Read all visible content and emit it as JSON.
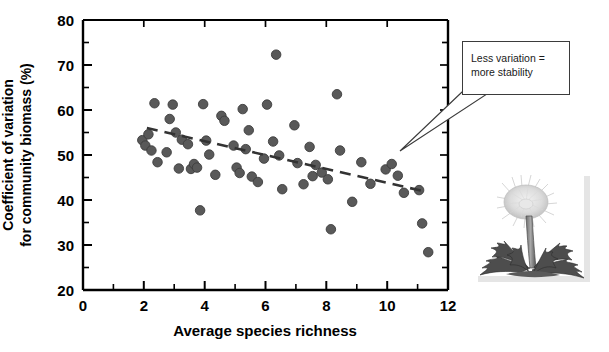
{
  "chart_data": {
    "type": "scatter",
    "title": "",
    "xlabel": "Average species richness",
    "ylabel": "Coefficient of variation\nfor community biomass (%)",
    "xlim": [
      0,
      12
    ],
    "ylim": [
      20,
      80
    ],
    "xticks": [
      0,
      2,
      4,
      6,
      8,
      10,
      12
    ],
    "yticks": [
      20,
      30,
      40,
      50,
      60,
      70,
      80
    ],
    "xtick_labels": [
      "0",
      "2",
      "4",
      "6",
      "8",
      "10",
      "12"
    ],
    "ytick_labels": [
      "20",
      "30",
      "40",
      "50",
      "60",
      "70",
      "80"
    ],
    "x_minor_ticks": [
      1,
      3,
      5,
      7,
      9,
      11
    ],
    "y_minor_ticks": [
      25,
      35,
      45,
      55,
      65,
      75
    ],
    "grid": false,
    "legend": null,
    "marker_color": "#595959",
    "marker_edge_color": "#3d3d3d",
    "marker_size": 9.5,
    "series": [
      {
        "name": "plots",
        "points": [
          [
            1.95,
            53.3
          ],
          [
            2.05,
            52.1
          ],
          [
            2.15,
            54.6
          ],
          [
            2.25,
            51.0
          ],
          [
            2.35,
            61.5
          ],
          [
            2.45,
            48.4
          ],
          [
            2.75,
            50.6
          ],
          [
            2.85,
            58.0
          ],
          [
            2.95,
            61.2
          ],
          [
            3.05,
            55.0
          ],
          [
            3.15,
            47.0
          ],
          [
            3.25,
            53.4
          ],
          [
            3.45,
            52.4
          ],
          [
            3.55,
            46.9
          ],
          [
            3.65,
            48.0
          ],
          [
            3.75,
            47.2
          ],
          [
            3.85,
            37.7
          ],
          [
            3.95,
            61.3
          ],
          [
            4.05,
            53.2
          ],
          [
            4.15,
            50.1
          ],
          [
            4.35,
            45.6
          ],
          [
            4.55,
            58.7
          ],
          [
            4.65,
            57.6
          ],
          [
            4.95,
            52.1
          ],
          [
            5.05,
            47.2
          ],
          [
            5.15,
            46.0
          ],
          [
            5.25,
            60.2
          ],
          [
            5.35,
            51.3
          ],
          [
            5.45,
            55.5
          ],
          [
            5.55,
            45.2
          ],
          [
            5.75,
            44.0
          ],
          [
            5.95,
            49.2
          ],
          [
            6.05,
            61.2
          ],
          [
            6.25,
            53.0
          ],
          [
            6.35,
            72.3
          ],
          [
            6.45,
            49.9
          ],
          [
            6.55,
            42.4
          ],
          [
            6.95,
            56.6
          ],
          [
            7.05,
            48.2
          ],
          [
            7.25,
            43.5
          ],
          [
            7.45,
            51.8
          ],
          [
            7.55,
            45.3
          ],
          [
            7.65,
            47.8
          ],
          [
            7.85,
            46.1
          ],
          [
            8.05,
            44.6
          ],
          [
            8.15,
            33.5
          ],
          [
            8.35,
            63.5
          ],
          [
            8.45,
            51.0
          ],
          [
            8.85,
            39.6
          ],
          [
            9.15,
            48.4
          ],
          [
            9.45,
            43.6
          ],
          [
            9.95,
            46.8
          ],
          [
            10.15,
            48.0
          ],
          [
            10.35,
            45.4
          ],
          [
            10.55,
            41.6
          ],
          [
            11.05,
            42.2
          ],
          [
            11.15,
            34.8
          ],
          [
            11.35,
            28.4
          ]
        ]
      }
    ],
    "trendline": {
      "style": "dashed",
      "color": "#333333",
      "x_start": 2.1,
      "y_start": 56.0,
      "x_end": 11.3,
      "y_end": 41.8
    },
    "annotations": [
      {
        "text": "Less variation =\nmore stability",
        "line1": "Less variation =",
        "line2": "more stability",
        "points_to_x": 9.6,
        "points_to_y": 46.5
      }
    ]
  },
  "axes": {
    "x_title": "Average species richness",
    "y_title": "Coefficient of variation\nfor community biomass (%)"
  },
  "annotation": {
    "line1": "Less variation =",
    "line2": "more stability"
  },
  "illustration": {
    "name": "dandelion-illustration",
    "alt": "dandelion plant"
  }
}
